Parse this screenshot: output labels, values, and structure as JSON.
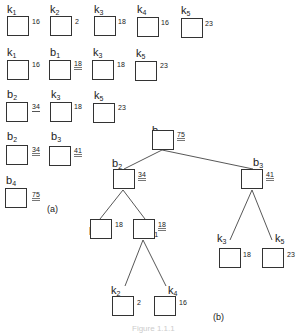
{
  "figure": {
    "part_a_label": "(a)",
    "part_b_label": "(b)",
    "caption": "Figure 1.1.1"
  },
  "part_a": {
    "rows": [
      [
        {
          "name": "k",
          "sub": "1",
          "weight": "16",
          "mark": "none"
        },
        {
          "name": "k",
          "sub": "2",
          "weight": "2",
          "mark": "none"
        },
        {
          "name": "k",
          "sub": "3",
          "weight": "18",
          "mark": "none"
        },
        {
          "name": "k",
          "sub": "4",
          "weight": "16",
          "mark": "none"
        },
        {
          "name": "k",
          "sub": "5",
          "weight": "23",
          "mark": "none"
        }
      ],
      [
        {
          "name": "k",
          "sub": "1",
          "weight": "16",
          "mark": "none"
        },
        {
          "name": "b",
          "sub": "1",
          "weight": "18",
          "mark": "double"
        },
        {
          "name": "k",
          "sub": "3",
          "weight": "18",
          "mark": "none"
        },
        {
          "name": "k",
          "sub": "5",
          "weight": "23",
          "mark": "none"
        }
      ],
      [
        {
          "name": "b",
          "sub": "2",
          "weight": "34",
          "mark": "single"
        },
        {
          "name": "k",
          "sub": "3",
          "weight": "18",
          "mark": "none"
        },
        {
          "name": "k",
          "sub": "5",
          "weight": "23",
          "mark": "none"
        }
      ],
      [
        {
          "name": "b",
          "sub": "2",
          "weight": "34",
          "mark": "double"
        },
        {
          "name": "b",
          "sub": "3",
          "weight": "41",
          "mark": "double"
        }
      ],
      [
        {
          "name": "b",
          "sub": "4",
          "weight": "75",
          "mark": "double"
        }
      ]
    ]
  },
  "part_b": {
    "nodes": [
      {
        "id": "b4",
        "name": "b",
        "sub": "4",
        "weight": "75"
      },
      {
        "id": "b2",
        "name": "b",
        "sub": "2",
        "weight": "34"
      },
      {
        "id": "b3",
        "name": "b",
        "sub": "3",
        "weight": "41"
      },
      {
        "id": "k1",
        "name": "k",
        "sub": "1",
        "weight": "16"
      },
      {
        "id": "b1",
        "name": "b",
        "sub": "1",
        "weight": "18"
      },
      {
        "id": "k3",
        "name": "k",
        "sub": "3",
        "weight": "18"
      },
      {
        "id": "k5",
        "name": "k",
        "sub": "5",
        "weight": "23"
      },
      {
        "id": "k2",
        "name": "k",
        "sub": "2",
        "weight": "2"
      },
      {
        "id": "k4",
        "name": "k",
        "sub": "4",
        "weight": "16"
      }
    ],
    "edges": [
      [
        "b4",
        "b2"
      ],
      [
        "b4",
        "b3"
      ],
      [
        "b2",
        "k1"
      ],
      [
        "b2",
        "b1"
      ],
      [
        "b3",
        "k3"
      ],
      [
        "b3",
        "k5"
      ],
      [
        "b1",
        "k2"
      ],
      [
        "b1",
        "k4"
      ]
    ]
  }
}
